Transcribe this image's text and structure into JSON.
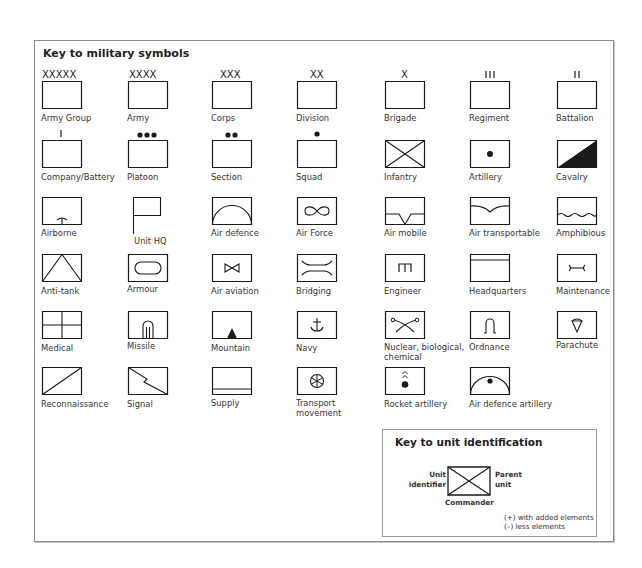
{
  "main": {
    "title": "Key to military symbols",
    "symbols": [
      {
        "label": "Army Group",
        "icon": "army-group-symbol",
        "echelon": "XXXXX"
      },
      {
        "label": "Army",
        "icon": "army-symbol",
        "echelon": "XXXX"
      },
      {
        "label": "Corps",
        "icon": "corps-symbol",
        "echelon": "XXX"
      },
      {
        "label": "Division",
        "icon": "division-symbol",
        "echelon": "XX"
      },
      {
        "label": "Brigade",
        "icon": "brigade-symbol",
        "echelon": "X"
      },
      {
        "label": "Regiment",
        "icon": "regiment-symbol",
        "echelon": "III"
      },
      {
        "label": "Battalion",
        "icon": "battalion-symbol",
        "echelon": "II"
      },
      {
        "label": "Company/Battery",
        "icon": "company-symbol",
        "echelon": "I"
      },
      {
        "label": "Platoon",
        "icon": "platoon-symbol",
        "echelon": "●●●"
      },
      {
        "label": "Section",
        "icon": "section-symbol",
        "echelon": "●●"
      },
      {
        "label": "Squad",
        "icon": "squad-symbol",
        "echelon": "●"
      },
      {
        "label": "Infantry",
        "icon": "infantry-symbol"
      },
      {
        "label": "Artillery",
        "icon": "artillery-symbol"
      },
      {
        "label": "Cavalry",
        "icon": "cavalry-symbol"
      },
      {
        "label": "Airborne",
        "icon": "airborne-symbol"
      },
      {
        "label": "Unit HQ",
        "icon": "unit-hq-symbol"
      },
      {
        "label": "Air defence",
        "icon": "air-defence-symbol"
      },
      {
        "label": "Air Force",
        "icon": "air-force-symbol"
      },
      {
        "label": "Air mobile",
        "icon": "air-mobile-symbol"
      },
      {
        "label": "Air transportable",
        "icon": "air-transportable-symbol"
      },
      {
        "label": "Amphibious",
        "icon": "amphibious-symbol"
      },
      {
        "label": "Anti-tank",
        "icon": "anti-tank-symbol"
      },
      {
        "label": "Armour",
        "icon": "armour-symbol"
      },
      {
        "label": "Air aviation",
        "icon": "air-aviation-symbol"
      },
      {
        "label": "Bridging",
        "icon": "bridging-symbol"
      },
      {
        "label": "Engineer",
        "icon": "engineer-symbol"
      },
      {
        "label": "Headquarters",
        "icon": "headquarters-symbol"
      },
      {
        "label": "Maintenance",
        "icon": "maintenance-symbol"
      },
      {
        "label": "Medical",
        "icon": "medical-symbol"
      },
      {
        "label": "Missile",
        "icon": "missile-symbol"
      },
      {
        "label": "Mountain",
        "icon": "mountain-symbol"
      },
      {
        "label": "Navy",
        "icon": "navy-symbol"
      },
      {
        "label": "Nuclear, biological, chemical",
        "icon": "nbc-symbol"
      },
      {
        "label": "Ordnance",
        "icon": "ordnance-symbol"
      },
      {
        "label": "Parachute",
        "icon": "parachute-symbol"
      },
      {
        "label": "Reconnaissance",
        "icon": "reconnaissance-symbol"
      },
      {
        "label": "Signal",
        "icon": "signal-symbol"
      },
      {
        "label": "Supply",
        "icon": "supply-symbol"
      },
      {
        "label": "Transport movement",
        "icon": "transport-movement-symbol"
      },
      {
        "label": "Rocket artillery",
        "icon": "rocket-artillery-symbol"
      },
      {
        "label": "Air defence artillery",
        "icon": "air-defence-artillery-symbol"
      }
    ]
  },
  "unit_identification": {
    "title": "Key to unit identification",
    "left_label_1": "Unit",
    "left_label_2": "identifier",
    "right_label_1": "Parent",
    "right_label_2": "unit",
    "bottom_label": "Commander",
    "note_1": "(+) with added elements",
    "note_2": "(–) less elements"
  },
  "colors": {
    "stroke": "#1a1a1a",
    "frame_border": "#8a8a8a",
    "text": "#333333"
  }
}
